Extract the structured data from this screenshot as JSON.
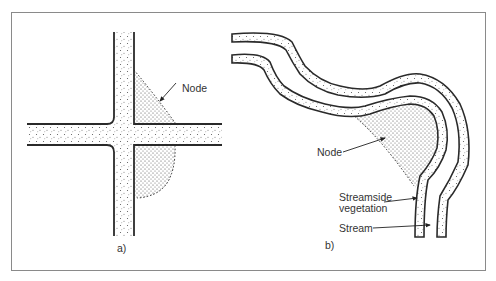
{
  "figure": {
    "panel_a": {
      "caption": "a)",
      "node_label": "Node",
      "description": "Road intersection with stippled nodes in corners"
    },
    "panel_b": {
      "caption": "b)",
      "node_label": "Node",
      "streamside_label_line1": "Streamside",
      "streamside_label_line2": "vegetation",
      "stream_label": "Stream",
      "description": "Meandering stream with streamside vegetation bands and node at bend"
    }
  },
  "colors": {
    "line": "#2a2a2a",
    "stipple": "#555555",
    "frame": "#8a8a8a",
    "background": "#ffffff"
  }
}
